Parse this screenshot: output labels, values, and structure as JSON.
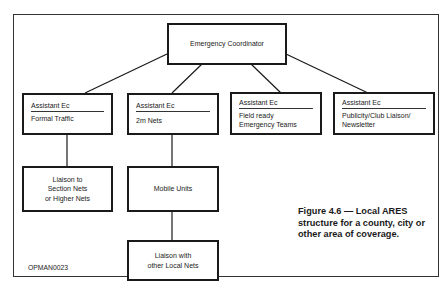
{
  "diagram": {
    "root": {
      "label": "Emergency Coordinator"
    },
    "assistants": [
      {
        "title": "Assistant Ec",
        "lines": [
          "Formal Traffic"
        ]
      },
      {
        "title": "Assistant Ec",
        "lines": [
          "2m Nets"
        ]
      },
      {
        "title": "Assistant Ec",
        "lines": [
          "Field ready",
          "Emergency Teams"
        ]
      },
      {
        "title": "Assistant Ec",
        "lines": [
          "Publicity/Club Liaison/",
          "Newsletter"
        ]
      }
    ],
    "sub_nodes": {
      "liaison_section": {
        "lines": [
          "Liaison to",
          "Section Nets",
          "or Higher Nets"
        ]
      },
      "mobile_units": {
        "lines": [
          "Mobile Units"
        ]
      },
      "liaison_local": {
        "lines": [
          "Liaison with",
          "other Local Nets"
        ]
      }
    },
    "caption": [
      "Figure 4.6 — Local",
      "ARES structure for a",
      "county, city or other",
      "area of coverage."
    ],
    "code": "OPMAN0023"
  }
}
